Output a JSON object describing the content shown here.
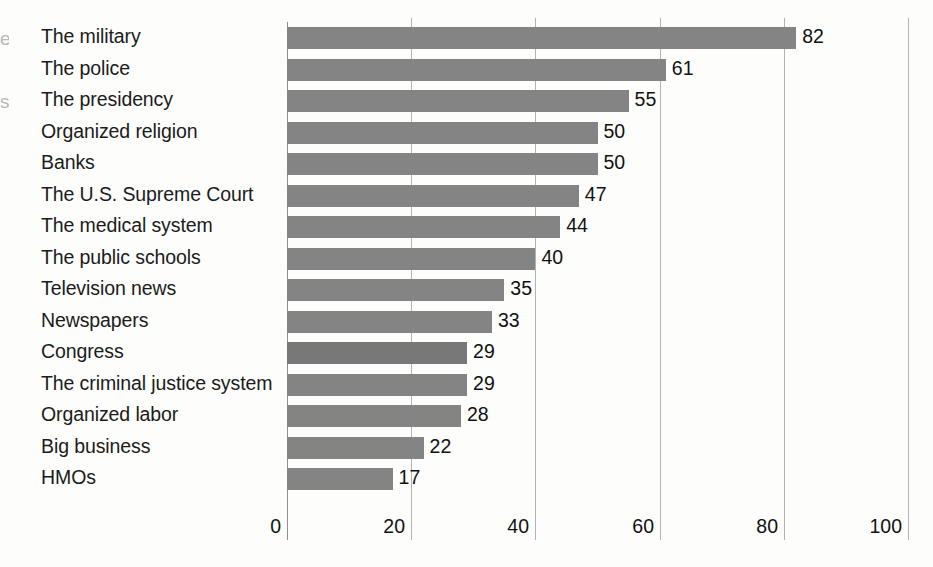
{
  "chart_data": {
    "type": "bar",
    "orientation": "horizontal",
    "title": "",
    "subtitle": "",
    "xlabel": "",
    "ylabel": "",
    "xlim": [
      0,
      100
    ],
    "xticks": [
      "0",
      "20",
      "40",
      "60",
      "80",
      "100"
    ],
    "xtick_values": [
      0,
      20,
      40,
      60,
      80,
      100
    ],
    "grid": "vertical",
    "legend": "none",
    "bar_color": "#848484",
    "background_color": "#fdfdfc",
    "gridline_color": "#b3b3b3",
    "text_color": "#1a1a1a",
    "show_value_labels": true,
    "categories": [
      "The military",
      "The police",
      "The presidency",
      "Organized religion",
      "Banks",
      "The U.S. Supreme Court",
      "The medical system",
      "The public schools",
      "Television news",
      "Newspapers",
      "Congress",
      "The criminal justice system",
      "Organized labor",
      "Big business",
      "HMOs"
    ],
    "values": [
      82,
      61,
      55,
      50,
      50,
      47,
      44,
      40,
      35,
      33,
      29,
      29,
      28,
      22,
      17
    ],
    "value_labels": [
      "82",
      "61",
      "55",
      "50",
      "50",
      "47",
      "44",
      "40",
      "35",
      "33",
      "29",
      "29",
      "28",
      "22",
      "17"
    ]
  },
  "edge_fragments": [
    {
      "text": "e",
      "top": 28
    },
    {
      "text": "s",
      "top": 91
    }
  ]
}
